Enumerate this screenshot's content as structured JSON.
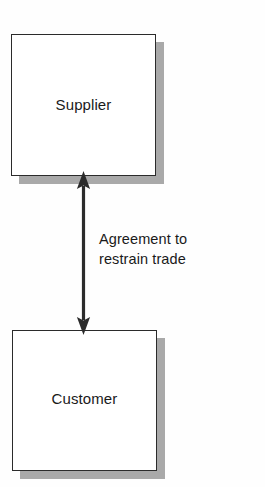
{
  "diagram": {
    "background_color": "#fefefe",
    "box_fill_color": "#ffffff",
    "box_border_color": "#2b2b2b",
    "shadow_color": "#a9a9a9",
    "arrow_color": "#2b2b2b",
    "text_color": "#1a1a1a",
    "nodes": [
      {
        "id": "supplier",
        "label": "Supplier"
      },
      {
        "id": "customer",
        "label": "Customer"
      }
    ],
    "edges": [
      {
        "id": "agreement",
        "from": "customer",
        "to": "supplier",
        "direction": "bidirectional",
        "label_line_1": "Agreement to",
        "label_line_2": "restrain trade"
      }
    ]
  }
}
